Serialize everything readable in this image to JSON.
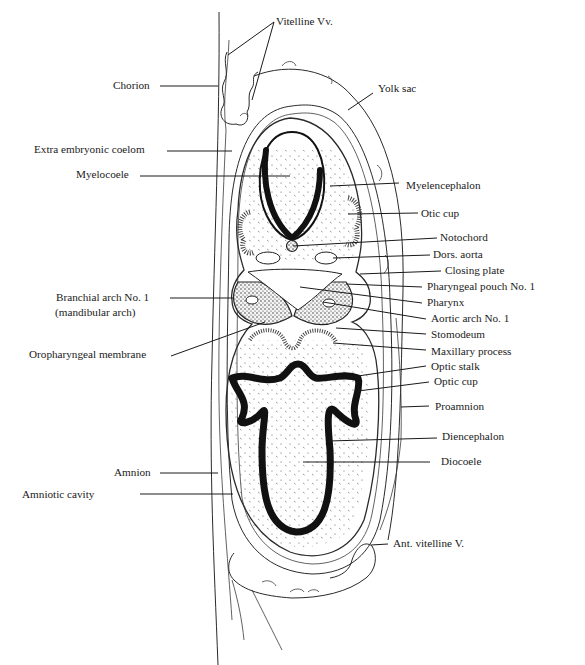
{
  "figure": {
    "labels": [
      {
        "id": "vitelline-vv",
        "text": "Vitelline Vv.",
        "x": 276,
        "y": 25,
        "anchor": "start",
        "lines": [
          [
            274,
            22,
            228,
            55
          ],
          [
            274,
            22,
            252,
            100
          ]
        ]
      },
      {
        "id": "chorion",
        "text": "Chorion",
        "x": 113,
        "y": 89,
        "anchor": "start",
        "lines": [
          [
            160,
            86,
            218,
            86
          ]
        ]
      },
      {
        "id": "yolk-sac",
        "text": "Yolk sac",
        "x": 378,
        "y": 92,
        "anchor": "start",
        "lines": [
          [
            373,
            93,
            348,
            110
          ]
        ]
      },
      {
        "id": "extra-embryonic-coelom",
        "text": "Extra embryonic coelom",
        "x": 34,
        "y": 153,
        "anchor": "start",
        "lines": [
          [
            167,
            151,
            232,
            151
          ]
        ]
      },
      {
        "id": "myelocoele",
        "text": "Myelocoele",
        "x": 76,
        "y": 178,
        "anchor": "start",
        "lines": [
          [
            140,
            176,
            290,
            176
          ]
        ]
      },
      {
        "id": "myelencephalon",
        "text": "Myelencephalon",
        "x": 406,
        "y": 189,
        "anchor": "start",
        "lines": [
          [
            399,
            183,
            330,
            186
          ]
        ]
      },
      {
        "id": "otic-cup",
        "text": "Otic cup",
        "x": 421,
        "y": 217,
        "anchor": "start",
        "lines": [
          [
            418,
            213,
            348,
            214
          ]
        ]
      },
      {
        "id": "notochord",
        "text": "Notochord",
        "x": 440,
        "y": 241,
        "anchor": "start",
        "lines": [
          [
            437,
            238,
            293,
            246
          ]
        ]
      },
      {
        "id": "dors-aorta",
        "text": "Dors. aorta",
        "x": 433,
        "y": 258,
        "anchor": "start",
        "lines": [
          [
            430,
            255,
            333,
            258
          ]
        ]
      },
      {
        "id": "closing-plate",
        "text": "Closing plate",
        "x": 445,
        "y": 274,
        "anchor": "start",
        "lines": [
          [
            441,
            271,
            360,
            274
          ]
        ]
      },
      {
        "id": "pharyngeal-pouch-no-1",
        "text": "Pharyngeal pouch No. 1",
        "x": 427,
        "y": 290,
        "anchor": "start",
        "lines": [
          [
            422,
            287,
            346,
            284
          ]
        ]
      },
      {
        "id": "pharynx",
        "text": "Pharynx",
        "x": 427,
        "y": 306,
        "anchor": "start",
        "lines": [
          [
            422,
            303,
            300,
            287
          ]
        ]
      },
      {
        "id": "aortic-arch-no-1",
        "text": "Aortic arch No. 1",
        "x": 431,
        "y": 322,
        "anchor": "start",
        "lines": [
          [
            426,
            319,
            323,
            302
          ]
        ]
      },
      {
        "id": "stomodeum",
        "text": "Stomodeum",
        "x": 431,
        "y": 338,
        "anchor": "start",
        "lines": [
          [
            426,
            334,
            336,
            328
          ]
        ]
      },
      {
        "id": "maxillary-process",
        "text": "Maxillary process",
        "x": 431,
        "y": 355,
        "anchor": "start",
        "lines": [
          [
            426,
            350,
            333,
            343
          ]
        ]
      },
      {
        "id": "optic-stalk",
        "text": "Optic stalk",
        "x": 431,
        "y": 370,
        "anchor": "start",
        "lines": [
          [
            426,
            366,
            358,
            376
          ]
        ]
      },
      {
        "id": "optic-cup",
        "text": "Optic cup",
        "x": 434,
        "y": 385,
        "anchor": "start",
        "lines": [
          [
            429,
            382,
            358,
            391
          ]
        ]
      },
      {
        "id": "proamnion",
        "text": "Proamnion",
        "x": 435,
        "y": 410,
        "anchor": "start",
        "lines": [
          [
            429,
            406,
            401,
            407
          ]
        ]
      },
      {
        "id": "diencephalon",
        "text": "Diencephalon",
        "x": 442,
        "y": 440,
        "anchor": "start",
        "lines": [
          [
            437,
            438,
            328,
            441
          ]
        ]
      },
      {
        "id": "diocoele",
        "text": "Diocoele",
        "x": 441,
        "y": 465,
        "anchor": "start",
        "lines": [
          [
            430,
            462,
            303,
            462
          ]
        ]
      },
      {
        "id": "branchial-arch-no-1",
        "text": "Branchial arch No. 1",
        "x": 56,
        "y": 301,
        "anchor": "start",
        "lines": [
          [
            170,
            298,
            233,
            298
          ]
        ]
      },
      {
        "id": "mandibular-arch",
        "text": "(mandibular arch)",
        "x": 55,
        "y": 316,
        "anchor": "start",
        "lines": []
      },
      {
        "id": "oropharyngeal-membrane",
        "text": "Oropharyngeal membrane",
        "x": 29,
        "y": 358,
        "anchor": "start",
        "lines": [
          [
            171,
            356,
            265,
            322
          ]
        ]
      },
      {
        "id": "amnion",
        "text": "Amnion",
        "x": 114,
        "y": 476,
        "anchor": "start",
        "lines": [
          [
            160,
            473,
            218,
            473
          ]
        ]
      },
      {
        "id": "amniotic-cavity",
        "text": "Amniotic cavity",
        "x": 22,
        "y": 498,
        "anchor": "start",
        "lines": [
          [
            140,
            494,
            233,
            494
          ]
        ]
      },
      {
        "id": "ant-vitelline-v",
        "text": "Ant. vitelline V.",
        "x": 393,
        "y": 547,
        "anchor": "start",
        "lines": [
          [
            388,
            544,
            371,
            545
          ]
        ]
      }
    ]
  }
}
